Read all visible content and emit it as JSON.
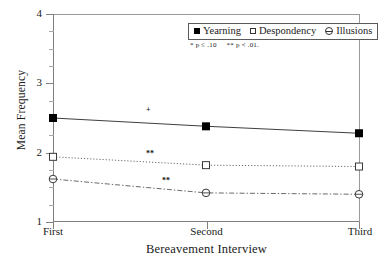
{
  "chart_data": {
    "type": "line",
    "title": "",
    "xlabel": "Bereavement Interview",
    "ylabel": "Mean Frequency",
    "categories": [
      "First",
      "Second",
      "Third"
    ],
    "ylim": [
      1,
      4
    ],
    "yticks": [
      1,
      2,
      3,
      4
    ],
    "ytick_labels": [
      "1",
      "2",
      "3",
      "4"
    ],
    "yminor_ticks": [
      1.25,
      1.5,
      1.75,
      2.25,
      2.5,
      2.75,
      3.25,
      3.5,
      3.75
    ],
    "grid": false,
    "legend_position": "top-right-inside",
    "series": [
      {
        "name": "Yearning",
        "marker": "filled-square",
        "line_style": "solid",
        "values": [
          2.5,
          2.38,
          2.28
        ]
      },
      {
        "name": "Despondency",
        "marker": "open-square",
        "line_style": "dotted",
        "values": [
          1.94,
          1.82,
          1.8
        ]
      },
      {
        "name": "Illusions",
        "marker": "open-circle-dash",
        "line_style": "dash-dot",
        "values": [
          1.62,
          1.42,
          1.4
        ]
      }
    ],
    "annotations": [
      {
        "text": "+",
        "series": "Yearning",
        "x_frac": 0.31,
        "value": 2.52
      },
      {
        "text": "**",
        "series": "Despondency",
        "x_frac": 0.32,
        "value": 1.92
      },
      {
        "text": "**",
        "series": "Illusions",
        "x_frac": 0.37,
        "value": 1.52
      }
    ],
    "significance_note": [
      "* p ≤ .10",
      "** p < .01."
    ]
  },
  "axis": {
    "y_title": "Mean Frequency",
    "x_title": "Bereavement Interview",
    "y_labels": [
      "4",
      "3",
      "2",
      "1"
    ],
    "x_labels": [
      "First",
      "Second",
      "Third"
    ]
  },
  "legend": {
    "items": [
      {
        "label": "Yearning",
        "marker": "filled-square"
      },
      {
        "label": "Despondency",
        "marker": "open-square"
      },
      {
        "label": "Illusions",
        "marker": "open-circle-dash"
      }
    ]
  },
  "notes": {
    "p10": "* p ≤ .10",
    "p01": "** p < .01."
  },
  "plot_annotations": {
    "yearning_mark": "+",
    "despondency_mark": "**",
    "illusions_mark": "**"
  },
  "colors": {
    "axis": "#808080",
    "line": "#555555",
    "marker_fill": "#000000",
    "marker_open": "#ffffff",
    "text": "#1a1a1a"
  }
}
